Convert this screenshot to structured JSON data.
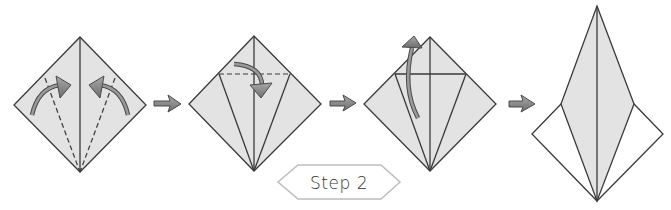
{
  "diagram": {
    "step_label": "Step 2",
    "colors": {
      "paper_fill": "#e3e3e3",
      "paper_white": "#ffffff",
      "line": "#3a3a3a",
      "arrow_fill": "#8c8c8c",
      "arrow_stroke": "#4a4a4a",
      "badge_stroke": "#bdbdbd"
    },
    "panels": [
      {
        "index": 1,
        "description": "Square base diamond; fold both lower edges to the center crease along dashed lines",
        "arrows": [
          "curved-arrow-right-fold",
          "curved-arrow-left-fold"
        ]
      },
      {
        "index": 2,
        "description": "Kite fold shown; fold top triangle down along dashed horizontal line",
        "arrows": [
          "curved-arrow-fold-down"
        ]
      },
      {
        "index": 3,
        "description": "Unfold and petal fold: lift bottom point up",
        "arrows": [
          "curved-arrow-lift-up"
        ]
      },
      {
        "index": 4,
        "description": "Result: elongated petal/kite shape over diamond",
        "arrows": []
      }
    ],
    "transition_arrows": 3
  }
}
